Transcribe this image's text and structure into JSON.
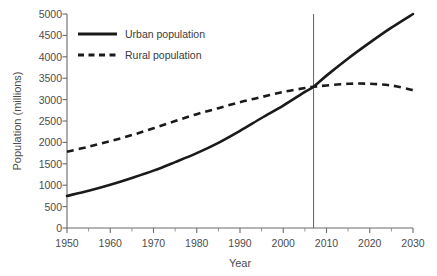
{
  "chart_data": {
    "type": "line",
    "title": "",
    "xlabel": "Year",
    "ylabel": "Population (millions)",
    "xlim": [
      1950,
      2030
    ],
    "ylim": [
      0,
      5000
    ],
    "xticks": [
      1950,
      1960,
      1970,
      1980,
      1990,
      2000,
      2010,
      2020,
      2030
    ],
    "yticks": [
      0,
      500,
      1000,
      1500,
      2000,
      2500,
      3000,
      3500,
      4000,
      4500,
      5000
    ],
    "grid": false,
    "legend_position": "top-left",
    "x": [
      1950,
      1955,
      1960,
      1965,
      1970,
      1975,
      1980,
      1985,
      1990,
      1995,
      2000,
      2005,
      2007,
      2010,
      2015,
      2020,
      2025,
      2030
    ],
    "series": [
      {
        "name": "Urban population",
        "style": "solid",
        "color": "#1a1a1a",
        "values": [
          750,
          870,
          1010,
          1170,
          1340,
          1540,
          1750,
          1990,
          2270,
          2570,
          2860,
          3180,
          3300,
          3560,
          3960,
          4330,
          4680,
          5000
        ]
      },
      {
        "name": "Rural population",
        "style": "dashed",
        "color": "#1a1a1a",
        "values": [
          1780,
          1900,
          2030,
          2170,
          2330,
          2500,
          2660,
          2800,
          2940,
          3060,
          3180,
          3270,
          3300,
          3330,
          3370,
          3370,
          3330,
          3220
        ]
      }
    ],
    "annotations": [
      {
        "type": "vertical-line",
        "name": "crossover-marker",
        "x": 2007,
        "label": ""
      }
    ]
  },
  "axes": {
    "x_title": "Year",
    "y_title": "Population (millions)",
    "x_tick_labels": [
      "1950",
      "1960",
      "1970",
      "1980",
      "1990",
      "2000",
      "2010",
      "2020",
      "2030"
    ],
    "y_tick_labels": [
      "0",
      "500",
      "1000",
      "1500",
      "2000",
      "2500",
      "3000",
      "3500",
      "4000",
      "4500",
      "5000"
    ]
  },
  "legend": {
    "items": [
      {
        "label": "Urban population",
        "style": "solid"
      },
      {
        "label": "Rural population",
        "style": "dashed"
      }
    ]
  },
  "colors": {
    "line": "#1a1a1a",
    "axis": "#6b6b6b",
    "text": "#4d4d4d",
    "background": "#ffffff"
  }
}
